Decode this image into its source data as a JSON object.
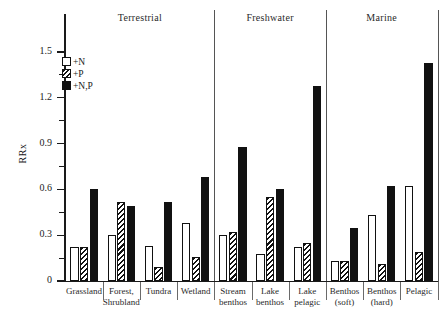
{
  "chart_data": {
    "type": "bar",
    "title": "",
    "xlabel": "",
    "ylabel": "RRx",
    "ylim": [
      0,
      1.6
    ],
    "yticks": [
      0,
      0.3,
      0.6,
      0.9,
      1.2,
      1.5
    ],
    "ytick_labels": [
      "0",
      "0.3",
      "0.6",
      "0.9",
      "1.2",
      "1.5"
    ],
    "minor_tick_step": 0.15,
    "grid": false,
    "legend_position": "upper-left-inside",
    "categories": [
      "Grassland",
      "Forest, Shrubland",
      "Tundra",
      "Wetland",
      "Stream benthos",
      "Lake benthos",
      "Lake pelagic",
      "Benthos (soft)",
      "Benthos (hard)",
      "Pelagic"
    ],
    "series": [
      {
        "name": "+N",
        "fill": "open",
        "values": [
          0.22,
          0.3,
          0.23,
          0.38,
          0.3,
          0.18,
          0.22,
          0.13,
          0.43,
          0.62
        ]
      },
      {
        "name": "+P",
        "fill": "hatch",
        "values": [
          0.22,
          0.52,
          0.09,
          0.16,
          0.32,
          0.55,
          0.25,
          0.13,
          0.11,
          0.19
        ]
      },
      {
        "name": "+N,P",
        "fill": "solid",
        "values": [
          0.6,
          0.49,
          0.52,
          0.68,
          0.88,
          0.6,
          1.28,
          0.35,
          0.62,
          1.43
        ]
      }
    ],
    "habitat_groups": [
      {
        "label": "Terrestrial",
        "categories": [
          "Grassland",
          "Forest, Shrubland",
          "Tundra",
          "Wetland"
        ]
      },
      {
        "label": "Freshwater",
        "categories": [
          "Stream benthos",
          "Lake benthos",
          "Lake pelagic"
        ]
      },
      {
        "label": "Marine",
        "categories": [
          "Benthos (soft)",
          "Benthos (hard)",
          "Pelagic"
        ]
      }
    ]
  },
  "axis": {
    "y_title": "RRx",
    "tick_labels": [
      "1.5",
      "1.2",
      "0.9",
      "0.6",
      "0.3",
      "0"
    ]
  },
  "legend": {
    "items": [
      {
        "label": "+N",
        "fill": "open"
      },
      {
        "label": "+P",
        "fill": "hatch"
      },
      {
        "label": "+N,P",
        "fill": "solid"
      }
    ]
  },
  "category_labels": [
    {
      "line1": "Grassland",
      "line2": ""
    },
    {
      "line1": "Forest,",
      "line2": "Shrubland"
    },
    {
      "line1": "Tundra",
      "line2": ""
    },
    {
      "line1": "Wetland",
      "line2": ""
    },
    {
      "line1": "Stream",
      "line2": "benthos"
    },
    {
      "line1": "Lake",
      "line2": "benthos"
    },
    {
      "line1": "Lake",
      "line2": "pelagic"
    },
    {
      "line1": "Benthos",
      "line2": "(soft)"
    },
    {
      "line1": "Benthos",
      "line2": "(hard)"
    },
    {
      "line1": "Pelagic",
      "line2": ""
    }
  ],
  "habitat_headers": [
    "Terrestrial",
    "Freshwater",
    "Marine"
  ],
  "colors": {
    "ink": "#1a1a1a",
    "bar_solid": "#111111",
    "background": "#ffffff"
  }
}
